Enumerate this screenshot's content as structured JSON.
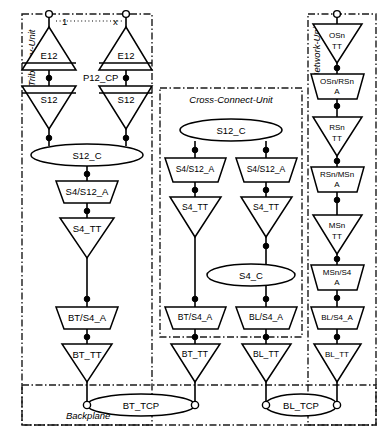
{
  "diagram": {
    "kind": "layered-transport-network-functional-architecture",
    "units": [
      {
        "id": "tributary",
        "label": "Tributary-Unit",
        "label_orientation": "vertical-left"
      },
      {
        "id": "cross-connect",
        "label": "Cross-Connect-Unit",
        "label_orientation": "horizontal-top"
      },
      {
        "id": "network",
        "label": "Network-Unit",
        "label_orientation": "vertical-left"
      },
      {
        "id": "backplane",
        "label": "Backplane",
        "label_orientation": "horizontal-bottom"
      }
    ],
    "top_index": {
      "first": "1",
      "last": "x",
      "dots": ". . . . . . . . ."
    },
    "access_point_label": "P12_CP",
    "tributary_unit": {
      "columns": [
        {
          "id": "trib-col-1",
          "blocks": [
            {
              "name": "E12",
              "shape": "trail-termination-up"
            },
            {
              "name": "S12",
              "shape": "trail-termination-down"
            }
          ]
        },
        {
          "id": "trib-col-x",
          "blocks": [
            {
              "name": "E12",
              "shape": "trail-termination-up"
            },
            {
              "name": "S12",
              "shape": "trail-termination-down"
            }
          ]
        }
      ],
      "connection_point": "S12_C",
      "chain": [
        {
          "name": "S4/S12_A",
          "shape": "adaptation"
        },
        {
          "name": "S4_TT",
          "shape": "trail-termination-down"
        },
        {
          "name": "BT/S4_A",
          "shape": "adaptation"
        },
        {
          "name": "BT_TT",
          "shape": "trail-termination-down"
        }
      ]
    },
    "cross_connect_unit": {
      "connection_point_top": "S12_C",
      "columns": [
        {
          "id": "ccu-col-left",
          "blocks": [
            {
              "name": "S4/S12_A",
              "shape": "adaptation"
            },
            {
              "name": "S4_TT",
              "shape": "trail-termination-down"
            },
            {
              "name": "BT/S4_A",
              "shape": "adaptation"
            },
            {
              "name": "BT_TT",
              "shape": "trail-termination-down"
            }
          ]
        },
        {
          "id": "ccu-col-right",
          "blocks": [
            {
              "name": "S4/S12_A",
              "shape": "adaptation"
            },
            {
              "name": "S4_TT",
              "shape": "trail-termination-down"
            },
            {
              "name": "BL/S4_A",
              "shape": "adaptation"
            },
            {
              "name": "BL_TT",
              "shape": "trail-termination-down"
            }
          ]
        }
      ],
      "connection_point_mid": "S4_C"
    },
    "network_unit": {
      "chain": [
        {
          "name": "OSn TT",
          "line1": "OSn",
          "line2": "TT",
          "shape": "trail-termination-down"
        },
        {
          "name": "OSn/RSn A",
          "line1": "OSn/RSn",
          "line2": "A",
          "shape": "adaptation"
        },
        {
          "name": "RSn TT",
          "line1": "RSn",
          "line2": "TT",
          "shape": "trail-termination-down"
        },
        {
          "name": "RSn/MSn A",
          "line1": "RSn/MSn",
          "line2": "A",
          "shape": "adaptation"
        },
        {
          "name": "MSn TT",
          "line1": "MSn",
          "line2": "TT",
          "shape": "trail-termination-down"
        },
        {
          "name": "MSn/S4 A",
          "line1": "MSn/S4",
          "line2": "A",
          "shape": "adaptation"
        },
        {
          "name": "BL/S4_A",
          "line1": "BL/S4_A",
          "line2": "",
          "shape": "adaptation"
        },
        {
          "name": "BL_TT",
          "line1": "BL_TT",
          "line2": "",
          "shape": "trail-termination-down"
        }
      ]
    },
    "backplane": {
      "connection_points": [
        {
          "name": "BT_TCP"
        },
        {
          "name": "BL_TCP"
        }
      ]
    },
    "colors": {
      "stroke": "#000000",
      "border": "#1a1a1a",
      "fill": "#ffffff",
      "background": "#ffffff"
    }
  }
}
